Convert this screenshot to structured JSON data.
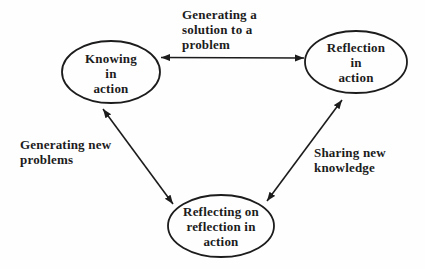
{
  "diagram": {
    "colors": {
      "ink": "#1c1c1c",
      "background": "#fefefe"
    },
    "nodes": [
      {
        "id": "knowing-in-action",
        "label": "Knowing\nin\naction",
        "shape": "ellipse"
      },
      {
        "id": "reflection-in-action",
        "label": "Reflection\nin\naction",
        "shape": "ellipse"
      },
      {
        "id": "reflecting-on-reflection-in-action",
        "label": "Reflecting on\nreflection in\naction",
        "shape": "ellipse"
      }
    ],
    "edges": [
      {
        "from": "knowing-in-action",
        "to": "reflection-in-action",
        "label": "Generating a\nsolution to a\nproblem",
        "direction": "bidirectional"
      },
      {
        "from": "knowing-in-action",
        "to": "reflecting-on-reflection-in-action",
        "label": "Generating new\nproblems",
        "direction": "bidirectional"
      },
      {
        "from": "reflection-in-action",
        "to": "reflecting-on-reflection-in-action",
        "label": "Sharing new\nknowledge",
        "direction": "bidirectional"
      }
    ]
  }
}
